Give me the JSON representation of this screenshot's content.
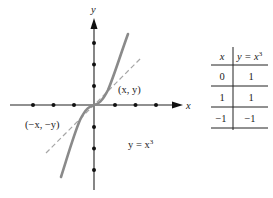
{
  "figure": {
    "axes": {
      "x_label": "x",
      "y_label": "y",
      "tick_marks_per_side": 3
    },
    "curve": {
      "equation_label": "y = x³",
      "equation_lhs": "y = x",
      "equation_exp": "3",
      "color": "#8a8a8a"
    },
    "symmetric_line": {
      "style": "dashed",
      "color": "#a0a0a0"
    },
    "points": [
      {
        "label": "(x, y)"
      },
      {
        "label": "(−x, −y)"
      }
    ]
  },
  "table": {
    "headers": [
      "x",
      "y = x³"
    ],
    "header_x": "x",
    "header_y_lhs": "y = x",
    "header_y_exp": "3",
    "rows": [
      {
        "x": "0",
        "y": "1"
      },
      {
        "x": "1",
        "y": "1"
      },
      {
        "x": "−1",
        "y": "−1"
      }
    ]
  }
}
